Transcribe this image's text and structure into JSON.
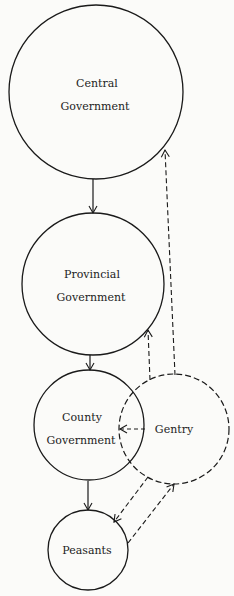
{
  "diagram": {
    "nodes": [
      {
        "id": "central",
        "lines": [
          "Central",
          "Government"
        ],
        "style": "solid"
      },
      {
        "id": "provincial",
        "lines": [
          "Provincial",
          "Government"
        ],
        "style": "solid"
      },
      {
        "id": "county",
        "lines": [
          "County",
          "Government"
        ],
        "style": "solid"
      },
      {
        "id": "gentry",
        "lines": [
          "Gentry"
        ],
        "style": "dashed"
      },
      {
        "id": "peasants",
        "lines": [
          "Peasants"
        ],
        "style": "solid"
      }
    ],
    "edges": [
      {
        "from": "central",
        "to": "provincial",
        "style": "solid"
      },
      {
        "from": "provincial",
        "to": "county",
        "style": "solid"
      },
      {
        "from": "county",
        "to": "peasants",
        "style": "solid"
      },
      {
        "from": "gentry",
        "to": "central",
        "style": "dashed"
      },
      {
        "from": "gentry",
        "to": "provincial",
        "style": "dashed"
      },
      {
        "from": "gentry",
        "to": "county",
        "style": "dashed"
      },
      {
        "from": "gentry",
        "to": "peasants",
        "style": "dashed"
      },
      {
        "from": "peasants",
        "to": "gentry",
        "style": "dashed"
      }
    ],
    "colors": {
      "stroke": "#1a1a1a",
      "background": "#fbfbf9"
    }
  }
}
